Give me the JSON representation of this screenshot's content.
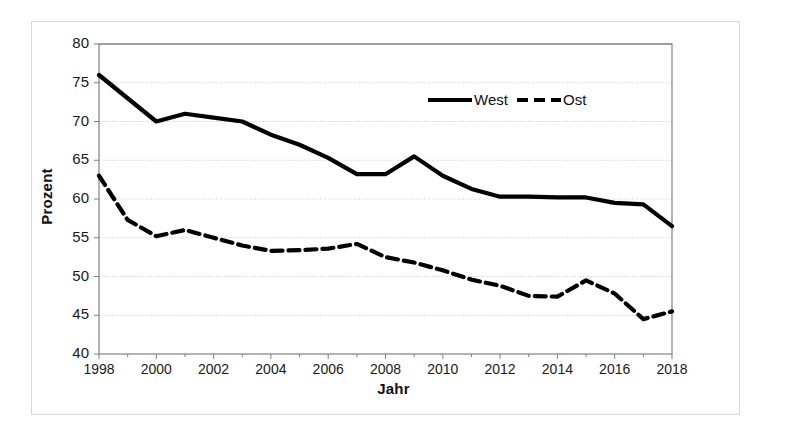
{
  "chart_data": {
    "type": "line",
    "title": "",
    "xlabel": "Jahr",
    "ylabel": "Prozent",
    "xlim": [
      1998,
      2018
    ],
    "ylim": [
      40,
      80
    ],
    "ytick_step": 5,
    "xtick_step": 2,
    "grid": true,
    "legend_position": "top-right-inside",
    "xticks": [
      "1998",
      "2000",
      "2002",
      "2004",
      "2006",
      "2008",
      "2010",
      "2012",
      "2014",
      "2016",
      "2018"
    ],
    "yticks": [
      "40",
      "45",
      "50",
      "55",
      "60",
      "65",
      "70",
      "75",
      "80"
    ],
    "x": [
      1998,
      1999,
      2000,
      2001,
      2002,
      2003,
      2004,
      2005,
      2006,
      2007,
      2008,
      2009,
      2010,
      2011,
      2012,
      2013,
      2014,
      2015,
      2016,
      2017,
      2018
    ],
    "series": [
      {
        "name": "West",
        "style": "solid",
        "color": "#000000",
        "values": [
          76.0,
          73.0,
          70.0,
          71.0,
          70.5,
          70.0,
          68.3,
          67.0,
          65.3,
          63.2,
          63.2,
          65.5,
          63.0,
          61.3,
          60.3,
          60.3,
          60.2,
          60.2,
          59.5,
          59.3,
          56.5
        ]
      },
      {
        "name": "Ost",
        "style": "dashed",
        "color": "#000000",
        "values": [
          63.0,
          57.3,
          55.2,
          56.0,
          55.0,
          54.0,
          53.3,
          53.4,
          53.6,
          54.2,
          52.5,
          51.8,
          50.8,
          49.6,
          48.8,
          47.5,
          47.4,
          49.5,
          47.8,
          44.5,
          45.5
        ]
      }
    ]
  },
  "legend": {
    "west_label": "West",
    "ost_label": "Ost"
  },
  "axes": {
    "x_title": "Jahr",
    "y_title": "Prozent"
  }
}
